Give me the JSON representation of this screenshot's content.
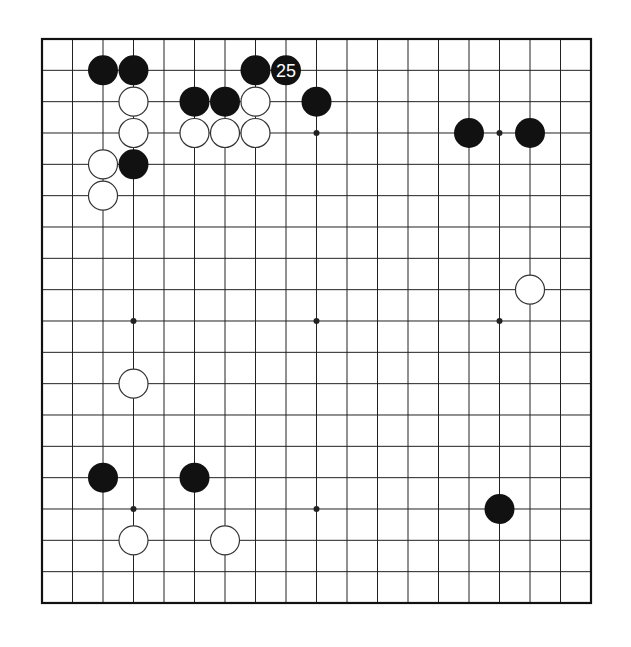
{
  "board": {
    "size": 19,
    "origin_x": 42,
    "origin_y": 39,
    "spacing_x": 30.5,
    "spacing_y": 31.333,
    "stone_radius": 15,
    "line_color": "#222222",
    "border_color": "#111111",
    "background": "#ffffff",
    "black_color": "#111111",
    "white_fill": "#ffffff",
    "white_stroke": "#333333",
    "star_points": [
      [
        3,
        3
      ],
      [
        3,
        9
      ],
      [
        3,
        15
      ],
      [
        9,
        3
      ],
      [
        9,
        9
      ],
      [
        9,
        15
      ],
      [
        15,
        3
      ],
      [
        15,
        9
      ],
      [
        15,
        15
      ]
    ]
  },
  "stones": [
    {
      "color": "black",
      "col": 2,
      "row": 1
    },
    {
      "color": "black",
      "col": 3,
      "row": 1
    },
    {
      "color": "black",
      "col": 7,
      "row": 1
    },
    {
      "color": "black",
      "col": 8,
      "row": 1,
      "label": "25"
    },
    {
      "color": "white",
      "col": 3,
      "row": 2
    },
    {
      "color": "black",
      "col": 5,
      "row": 2
    },
    {
      "color": "black",
      "col": 6,
      "row": 2
    },
    {
      "color": "white",
      "col": 7,
      "row": 2
    },
    {
      "color": "black",
      "col": 9,
      "row": 2
    },
    {
      "color": "white",
      "col": 3,
      "row": 3
    },
    {
      "color": "white",
      "col": 5,
      "row": 3
    },
    {
      "color": "white",
      "col": 6,
      "row": 3
    },
    {
      "color": "white",
      "col": 7,
      "row": 3
    },
    {
      "color": "black",
      "col": 14,
      "row": 3
    },
    {
      "color": "black",
      "col": 16,
      "row": 3
    },
    {
      "color": "white",
      "col": 2,
      "row": 4
    },
    {
      "color": "black",
      "col": 3,
      "row": 4
    },
    {
      "color": "white",
      "col": 2,
      "row": 5
    },
    {
      "color": "white",
      "col": 16,
      "row": 8
    },
    {
      "color": "white",
      "col": 3,
      "row": 11
    },
    {
      "color": "black",
      "col": 2,
      "row": 14
    },
    {
      "color": "black",
      "col": 5,
      "row": 14
    },
    {
      "color": "black",
      "col": 15,
      "row": 15
    },
    {
      "color": "white",
      "col": 3,
      "row": 16
    },
    {
      "color": "white",
      "col": 6,
      "row": 16
    }
  ]
}
